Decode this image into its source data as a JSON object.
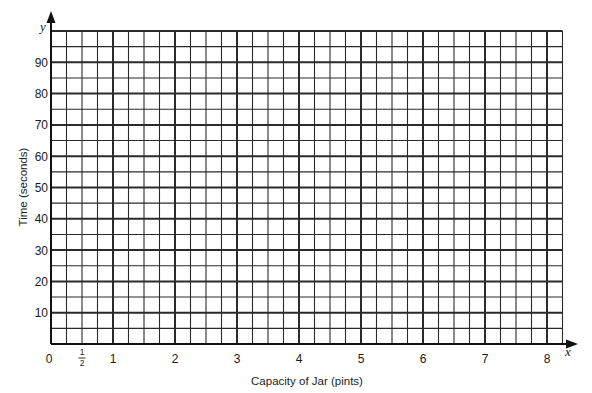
{
  "chart_data": {
    "type": "line",
    "title": "",
    "xlabel": "Capacity of Jar (pints)",
    "ylabel": "Time (seconds)",
    "x_axis_symbol": "x",
    "y_axis_symbol": "y",
    "xlim": [
      0,
      8.25
    ],
    "ylim": [
      0,
      100
    ],
    "x_ticks": [
      {
        "value": 0,
        "label": "0"
      },
      {
        "value": 0.5,
        "label": "1/2",
        "fraction": true,
        "num": "1",
        "den": "2"
      },
      {
        "value": 1,
        "label": "1"
      },
      {
        "value": 2,
        "label": "2"
      },
      {
        "value": 3,
        "label": "3"
      },
      {
        "value": 4,
        "label": "4"
      },
      {
        "value": 5,
        "label": "5"
      },
      {
        "value": 6,
        "label": "6"
      },
      {
        "value": 7,
        "label": "7"
      },
      {
        "value": 8,
        "label": "8"
      }
    ],
    "y_ticks": [
      {
        "value": 10,
        "label": "10"
      },
      {
        "value": 20,
        "label": "20"
      },
      {
        "value": 30,
        "label": "30"
      },
      {
        "value": 40,
        "label": "40"
      },
      {
        "value": 50,
        "label": "50"
      },
      {
        "value": 60,
        "label": "60"
      },
      {
        "value": 70,
        "label": "70"
      },
      {
        "value": 80,
        "label": "80"
      },
      {
        "value": 90,
        "label": "90"
      }
    ],
    "grid": true,
    "x_minor_step": 0.25,
    "y_minor_step": 5,
    "series": [],
    "legend": null
  },
  "colors": {
    "grid_line": "#2a2a2a",
    "axis": "#111111",
    "background": "#ffffff"
  }
}
